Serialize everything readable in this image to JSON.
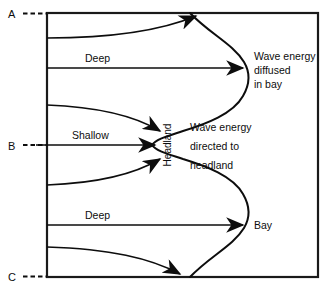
{
  "diagram": {
    "markers": [
      {
        "id": "A",
        "label": "A",
        "y": 13
      },
      {
        "id": "B",
        "label": "B",
        "y": 145
      },
      {
        "id": "C",
        "label": "C",
        "y": 277
      }
    ],
    "labels": {
      "deep_top": "Deep",
      "shallow": "Shallow",
      "deep_bottom": "Deep",
      "headland": "Headland",
      "bay": "Bay"
    },
    "annotations": {
      "bay_note": {
        "line1": "Wave energy",
        "line2": "diffused",
        "line3": "in bay"
      },
      "headland_note": {
        "line1": "Wave energy",
        "line2": "directed to",
        "line3": "headland"
      }
    },
    "colors": {
      "ink": "#0d0d0d",
      "background": "#ffffff",
      "border": "#1a1a1a"
    },
    "frame": {
      "x": 47,
      "y": 13,
      "width": 271,
      "height": 264
    },
    "ray_count": 7,
    "coastline_type": "sinusoidal-headland-bay"
  }
}
